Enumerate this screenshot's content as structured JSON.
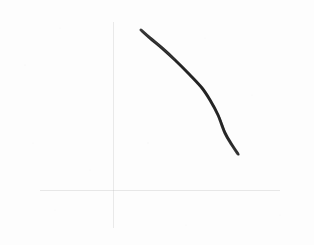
{
  "figure": {
    "kind": "hand-drawn-sketch-plot",
    "background_color": "#fdfdfd",
    "width": 314,
    "height": 245,
    "title": "",
    "subtitle": "",
    "annotations": []
  },
  "axes": {
    "style": "bare-crosshair",
    "color": "#a9a9a9",
    "stroke_width": 1,
    "origin": {
      "x": 114,
      "y": 191
    },
    "vertical": {
      "label": "",
      "tick_labels": [],
      "x": 114,
      "y_top": 8,
      "y_bottom": 240
    },
    "horizontal": {
      "label": "",
      "tick_labels": [],
      "y": 191,
      "x_left": 22,
      "x_right": 298
    },
    "grid": false
  },
  "chart_data": {
    "type": "line",
    "title": "",
    "subtitle": "",
    "xlabel": "",
    "ylabel": "",
    "legend": [],
    "legend_position": "none",
    "grid": false,
    "xlim": [
      0,
      314
    ],
    "ylim": [
      0,
      245
    ],
    "axis_ticks": {
      "x": [],
      "y": []
    },
    "series": [
      {
        "name": "sketched-curve",
        "color": "#2e2e2e",
        "stroke_width": 3,
        "style": "solid",
        "marker": "none",
        "shape": "concave-down decreasing arc",
        "x": [
          141,
          150,
          162,
          175,
          190,
          202,
          210,
          218,
          225,
          232,
          238
        ],
        "y": [
          30,
          38,
          48,
          60,
          75,
          88,
          100,
          115,
          133,
          145,
          154
        ]
      }
    ]
  }
}
